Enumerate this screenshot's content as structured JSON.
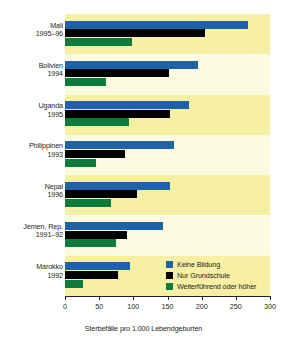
{
  "chart_data": {
    "type": "bar",
    "orientation": "horizontal",
    "title": "",
    "xlabel": "Sterbefälle pro 1.000 Lebendgeburten",
    "ylabel": "",
    "xlim": [
      0,
      300
    ],
    "xticks": [
      0,
      50,
      100,
      150,
      200,
      250,
      300
    ],
    "xtick_labels": [
      "0",
      "50",
      "100",
      "150",
      "200",
      "250",
      "300"
    ],
    "grid": false,
    "legend_position": "inside-bottom-right",
    "categories": [
      "Mali\n1995–96",
      "Bolivien\n1994",
      "Uganda\n1995",
      "Philippinen\n1993",
      "Nepal\n1996",
      "Jemen, Rep.\n1991–92",
      "Marokko\n1992"
    ],
    "category_lines": [
      [
        "Mali",
        "1995–96"
      ],
      [
        "Bolivien",
        "1994"
      ],
      [
        "Uganda",
        "1995"
      ],
      [
        "Philippinen",
        "1993"
      ],
      [
        "Nepal",
        "1996"
      ],
      [
        "Jemen, Rep.",
        "1991–92"
      ],
      [
        "Marokko",
        "1992"
      ]
    ],
    "series": [
      {
        "name": "Keine Bildung",
        "color": "#1d63a6",
        "values": [
          268,
          195,
          182,
          160,
          153,
          143,
          95
        ]
      },
      {
        "name": "Nur Grundschule",
        "color": "#000000",
        "values": [
          205,
          152,
          153,
          88,
          105,
          90,
          77
        ]
      },
      {
        "name": "Weiterführend oder höher",
        "color": "#0c7c3e",
        "values": [
          98,
          60,
          93,
          45,
          68,
          75,
          27
        ]
      }
    ]
  },
  "legend": {
    "items": [
      {
        "label": "Keine Bildung",
        "color": "#1d63a6"
      },
      {
        "label": "Nur Grundschule",
        "color": "#000000"
      },
      {
        "label": "Weiterführend oder höher",
        "color": "#0c7c3e"
      }
    ]
  },
  "axis": {
    "x_title": "Sterbefälle pro 1.000 Lebendgeburten",
    "tick_labels": [
      "0",
      "50",
      "100",
      "150",
      "200",
      "250",
      "300"
    ]
  },
  "colors": {
    "band_odd": "#f6efa4",
    "band_even": "#fcfbdf",
    "series_no_education": "#1d63a6",
    "series_primary_only": "#000000",
    "series_secondary_plus": "#0c7c3e",
    "text": "#231f20"
  }
}
